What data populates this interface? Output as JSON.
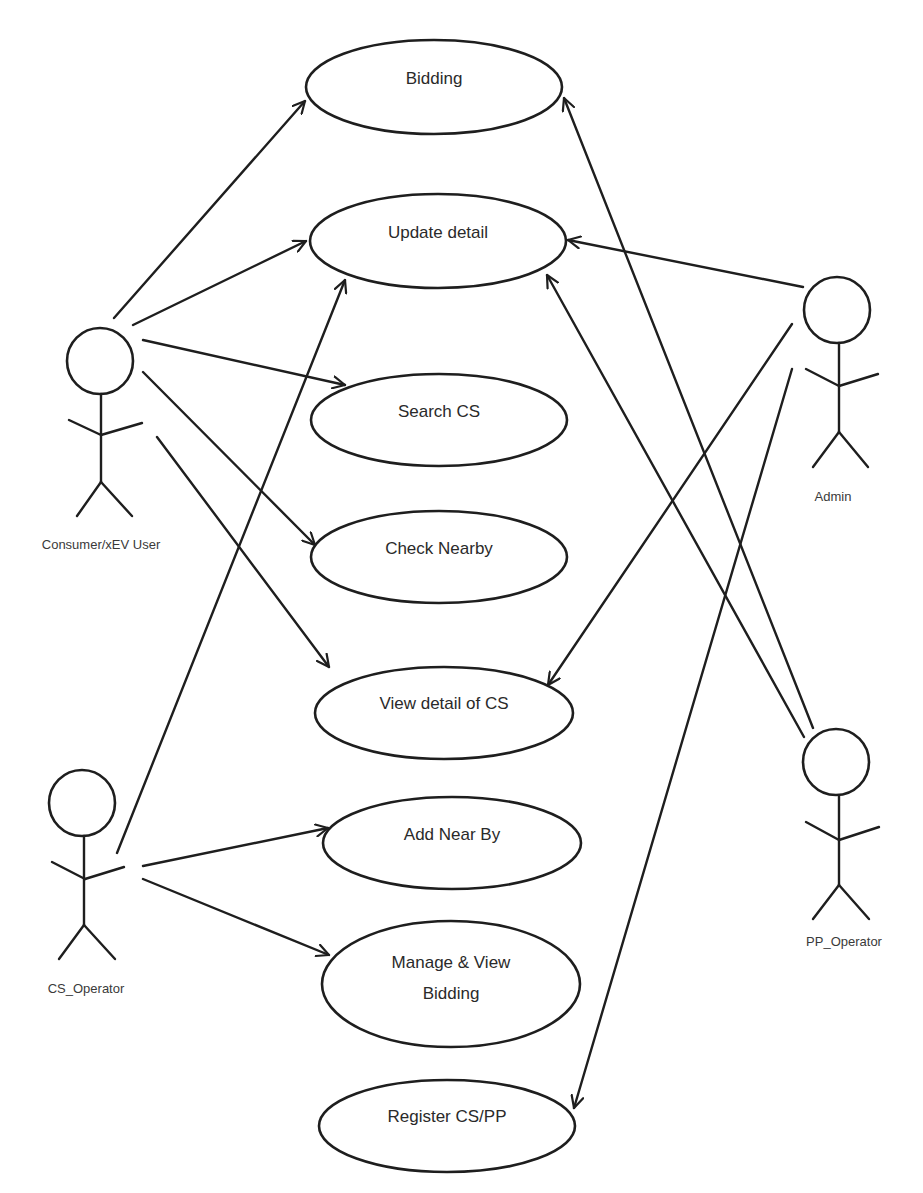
{
  "diagram": {
    "type": "use-case",
    "colors": {
      "stroke": "#1e1e1e",
      "text": "#2a2a2a",
      "background": "#ffffff"
    },
    "use_cases": [
      {
        "id": "bidding",
        "label": "Bidding",
        "cx": 434,
        "cy": 87,
        "rx": 128,
        "ry": 47
      },
      {
        "id": "update_detail",
        "label": "Update detail",
        "cx": 438,
        "cy": 241,
        "rx": 128,
        "ry": 47
      },
      {
        "id": "search_cs",
        "label": "Search CS",
        "cx": 439,
        "cy": 420,
        "rx": 128,
        "ry": 46
      },
      {
        "id": "check_nearby",
        "label": "Check Nearby",
        "cx": 439,
        "cy": 557,
        "rx": 128,
        "ry": 46
      },
      {
        "id": "view_detail_cs",
        "label": "View detail of CS",
        "cx": 444,
        "cy": 713,
        "rx": 129,
        "ry": 46
      },
      {
        "id": "add_near_by",
        "label": "Add Near By",
        "cx": 452,
        "cy": 843,
        "rx": 129,
        "ry": 46
      },
      {
        "id": "manage_view_bidding",
        "label_line1": "Manage & View",
        "label_line2": "Bidding",
        "cx": 451,
        "cy": 984,
        "rx": 129,
        "ry": 63
      },
      {
        "id": "register_cs_pp",
        "label": "Register CS/PP",
        "cx": 447,
        "cy": 1126,
        "rx": 128,
        "ry": 46
      }
    ],
    "actors": [
      {
        "id": "consumer",
        "label": "Consumer/xEV User",
        "head": {
          "cx": 100,
          "cy": 361,
          "r": 33
        }
      },
      {
        "id": "cs_operator",
        "label": "CS_Operator",
        "head": {
          "cx": 82,
          "cy": 803,
          "r": 33
        }
      },
      {
        "id": "admin",
        "label": "Admin",
        "head": {
          "cx": 837,
          "cy": 310,
          "r": 33
        }
      },
      {
        "id": "pp_operator",
        "label": "PP_Operator",
        "head": {
          "cx": 836,
          "cy": 762,
          "r": 33
        }
      }
    ],
    "associations": [
      {
        "from": "Consumer/xEV User",
        "to": "Bidding"
      },
      {
        "from": "Consumer/xEV User",
        "to": "Update detail"
      },
      {
        "from": "Consumer/xEV User",
        "to": "Search CS"
      },
      {
        "from": "Consumer/xEV User",
        "to": "Check Nearby"
      },
      {
        "from": "Consumer/xEV User",
        "to": "View detail of CS"
      },
      {
        "from": "CS_Operator",
        "to": "Update detail"
      },
      {
        "from": "CS_Operator",
        "to": "Add Near By"
      },
      {
        "from": "CS_Operator",
        "to": "Manage & View Bidding"
      },
      {
        "from": "Admin",
        "to": "Update detail"
      },
      {
        "from": "Admin",
        "to": "View detail of CS"
      },
      {
        "from": "Admin",
        "to": "Register CS/PP"
      },
      {
        "from": "PP_Operator",
        "to": "Bidding"
      },
      {
        "from": "PP_Operator",
        "to": "Update detail"
      }
    ]
  }
}
